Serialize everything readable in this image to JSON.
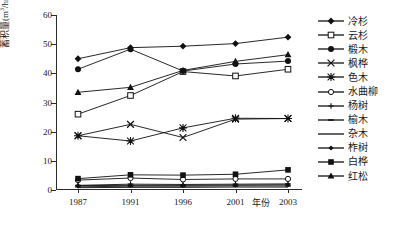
{
  "chart_data": {
    "type": "line",
    "title": "",
    "xlabel": "年份",
    "ylabel": "蓄积量(m3/hm2)",
    "ylabel_main": "蓄积量(m",
    "ylabel_sup1": "3",
    "ylabel_mid": "/hm",
    "ylabel_sup2": "2",
    "ylabel_end": ")",
    "categories": [
      "1987",
      "1991",
      "1996",
      "2001",
      "2003"
    ],
    "x": [
      1987,
      1991,
      1996,
      2001,
      2003
    ],
    "ylim": [
      0,
      60
    ],
    "yticks": [
      0,
      10,
      20,
      30,
      40,
      50,
      60
    ],
    "grid": false,
    "legend_position": "right",
    "series": [
      {
        "name": "冷杉",
        "marker": "filled-diamond",
        "values": [
          45.0,
          48.8,
          49.3,
          50.2,
          52.4
        ]
      },
      {
        "name": "云杉",
        "marker": "open-square",
        "values": [
          26.0,
          32.4,
          40.6,
          39.1,
          41.4
        ]
      },
      {
        "name": "椴木",
        "marker": "filled-circle",
        "values": [
          41.4,
          48.3,
          40.8,
          43.2,
          44.2
        ]
      },
      {
        "name": "枫桦",
        "marker": "x-cross",
        "values": [
          18.6,
          22.5,
          18.0,
          24.3,
          24.5
        ]
      },
      {
        "name": "色木",
        "marker": "asterisk",
        "values": [
          18.6,
          16.8,
          21.3,
          24.6,
          24.5
        ]
      },
      {
        "name": "水曲柳",
        "marker": "open-circle",
        "values": [
          3.4,
          4.1,
          3.6,
          3.8,
          3.8
        ]
      },
      {
        "name": "杨树",
        "marker": "plus",
        "values": [
          1.6,
          2.0,
          1.9,
          2.0,
          2.1
        ]
      },
      {
        "name": "榆木",
        "marker": "dash",
        "values": [
          1.1,
          1.3,
          1.3,
          1.4,
          1.4
        ]
      },
      {
        "name": "杂木",
        "marker": "line",
        "values": [
          0.8,
          0.9,
          0.9,
          1.0,
          1.0
        ]
      },
      {
        "name": "柞树",
        "marker": "filled-diamond-sm",
        "values": [
          1.5,
          1.6,
          1.6,
          1.7,
          1.8
        ]
      },
      {
        "name": "白桦",
        "marker": "filled-square",
        "values": [
          3.9,
          5.2,
          5.1,
          5.4,
          6.9
        ]
      },
      {
        "name": "红松",
        "marker": "filled-triangle",
        "values": [
          33.5,
          35.2,
          41.0,
          44.1,
          46.4
        ]
      }
    ]
  }
}
